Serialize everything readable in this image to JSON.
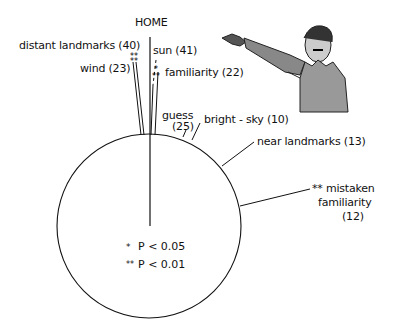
{
  "diagram": {
    "title": "HOME",
    "type": "circular orientation diagram",
    "vectors": [
      {
        "label": "distant landmarks (40)",
        "name": "distant landmarks",
        "n": 40,
        "significance": "**"
      },
      {
        "label": "wind (23)",
        "name": "wind",
        "n": 23,
        "significance": "**"
      },
      {
        "label": "sun (41)",
        "name": "sun",
        "n": 41,
        "significance": ""
      },
      {
        "label": "familiarity (22)",
        "name": "familiarity",
        "n": 22,
        "significance": "**"
      },
      {
        "label": "guess",
        "label2": "(25)",
        "name": "guess",
        "n": 25,
        "significance": ""
      },
      {
        "label": "bright - sky (10)",
        "name": "bright - sky",
        "n": 10,
        "significance": ""
      },
      {
        "label": "near landmarks (13)",
        "name": "near landmarks",
        "n": 13,
        "significance": ""
      },
      {
        "label": "** mistaken",
        "label2": "familiarity",
        "label3": "(12)",
        "name": "mistaken familiarity",
        "n": 12,
        "significance": "**"
      }
    ],
    "legend": [
      {
        "symbol": "*",
        "text": "P < 0.05"
      },
      {
        "symbol": "**",
        "text": "P < 0.01"
      }
    ],
    "illustration": "man-pointing"
  },
  "colors": {
    "ink": "#111111",
    "background": "#ffffff"
  }
}
